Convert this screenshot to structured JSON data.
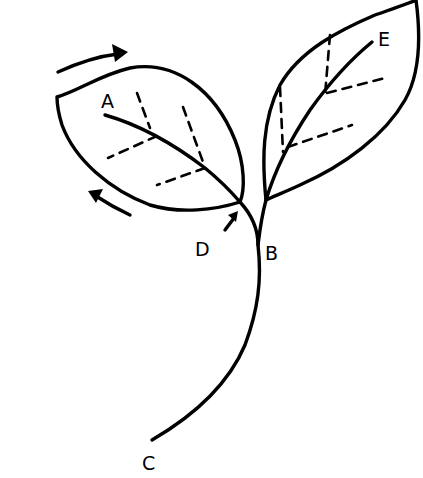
{
  "diagram": {
    "type": "botanical line drawing",
    "colors": {
      "ink": "#000000",
      "background": "#ffffff"
    },
    "labels": [
      {
        "id": "A",
        "text": "A",
        "x": 101,
        "y": 108
      },
      {
        "id": "B",
        "text": "B",
        "x": 265,
        "y": 260
      },
      {
        "id": "C",
        "text": "C",
        "x": 142,
        "y": 470
      },
      {
        "id": "D",
        "text": "D",
        "x": 195,
        "y": 256
      },
      {
        "id": "E",
        "text": "E",
        "x": 378,
        "y": 46
      }
    ],
    "arrows": [
      {
        "name": "top-arrow",
        "direction": "clockwise along left leaf top edge"
      },
      {
        "name": "bottom-arrow",
        "direction": "along left leaf bottom edge toward base"
      },
      {
        "name": "junction-arrow",
        "direction": "pointing at leaf base D"
      }
    ]
  }
}
